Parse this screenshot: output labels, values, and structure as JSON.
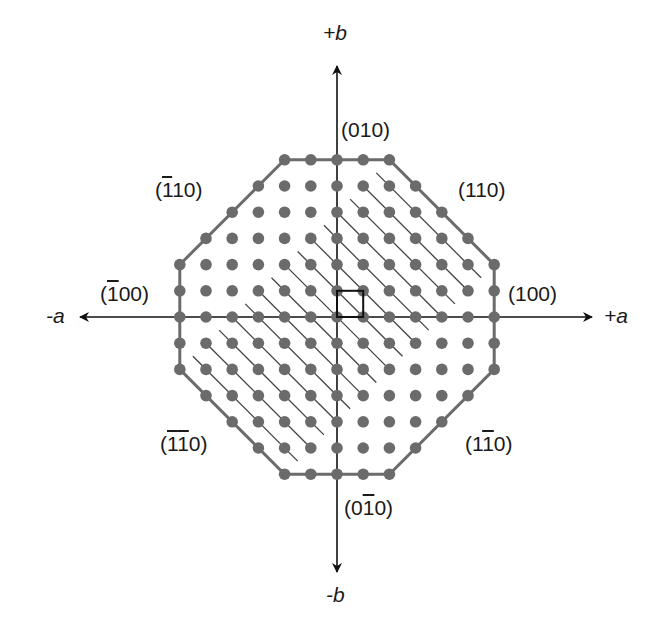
{
  "diagram": {
    "axes": {
      "plus_b": "+b",
      "minus_b": "-b",
      "plus_a": "+a",
      "minus_a": "-a"
    },
    "faces": [
      {
        "id": "010",
        "parts": [
          {
            "t": "(0"
          },
          {
            "t": "1"
          },
          {
            "t": "0)"
          }
        ]
      },
      {
        "id": "110",
        "parts": [
          {
            "t": "(1"
          },
          {
            "t": "1"
          },
          {
            "t": "0)"
          }
        ]
      },
      {
        "id": "-110",
        "parts": [
          {
            "t": "("
          },
          {
            "t": "1",
            "bar": true
          },
          {
            "t": "10)"
          }
        ]
      },
      {
        "id": "100",
        "parts": [
          {
            "t": "(1"
          },
          {
            "t": "00)"
          }
        ]
      },
      {
        "id": "-100",
        "parts": [
          {
            "t": "("
          },
          {
            "t": "1",
            "bar": true
          },
          {
            "t": "00)"
          }
        ]
      },
      {
        "id": "-1-10",
        "parts": [
          {
            "t": "("
          },
          {
            "t": "1",
            "bar": true
          },
          {
            "t": "1",
            "bar": true
          },
          {
            "t": "0)"
          }
        ]
      },
      {
        "id": "1-10",
        "parts": [
          {
            "t": "(1"
          },
          {
            "t": "1",
            "bar": true
          },
          {
            "t": "0)"
          }
        ]
      },
      {
        "id": "0-10",
        "parts": [
          {
            "t": "(0"
          },
          {
            "t": "1",
            "bar": true
          },
          {
            "t": "0)"
          }
        ]
      }
    ],
    "lattice": {
      "origin_px": [
        337,
        317
      ],
      "spacing_px": 26.2,
      "range": 6,
      "corner_cut": 8,
      "dot_color": "#6b6b6b",
      "outline_color": "#6b6b6b",
      "hatch_color": "#444444",
      "axis_color": "#111111",
      "hatch_sum_range": [
        -8,
        8
      ],
      "hatch_diff_range": [
        -4,
        4
      ]
    },
    "unit_cell": {
      "i0": 0,
      "j0": 0,
      "i1": 1,
      "j1": 1
    }
  }
}
